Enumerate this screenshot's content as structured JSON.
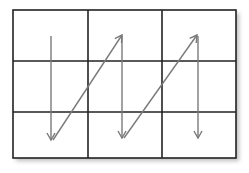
{
  "diagram": {
    "type": "grid-scan-order",
    "grid": {
      "rows": 3,
      "cols": 3
    },
    "frame": {
      "x": 13,
      "y": 10,
      "width": 223,
      "height": 148
    },
    "col_lines_x": [
      88,
      162
    ],
    "row_lines_y": [
      61,
      112
    ],
    "colors": {
      "grid": "#222222",
      "arrow": "#7a7a7a",
      "shadow": "#bdbdbd",
      "background": "#ffffff"
    },
    "arrows": [
      {
        "kind": "down",
        "x1": 51,
        "y1": 36,
        "x2": 51,
        "y2": 140
      },
      {
        "kind": "diagonal-up",
        "x1": 53,
        "y1": 140,
        "x2": 122,
        "y2": 35
      },
      {
        "kind": "down",
        "x1": 122,
        "y1": 36,
        "x2": 122,
        "y2": 138
      },
      {
        "kind": "diagonal-up",
        "x1": 124,
        "y1": 138,
        "x2": 197,
        "y2": 35
      },
      {
        "kind": "down",
        "x1": 198,
        "y1": 36,
        "x2": 198,
        "y2": 138
      }
    ]
  }
}
